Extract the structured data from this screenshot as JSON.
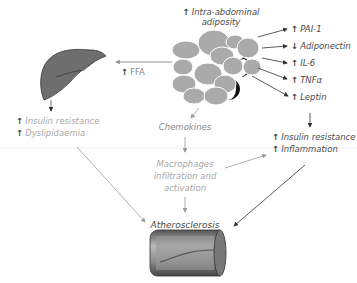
{
  "diagram": {
    "top_label": {
      "line1": "Intra-abdominal",
      "line2": "adiposity",
      "direction": "up"
    },
    "adipokines": [
      {
        "label": "PAI-1",
        "direction": "up"
      },
      {
        "label": "Adiponectin",
        "direction": "down"
      },
      {
        "label": "IL-6",
        "direction": "up"
      },
      {
        "label": "TNFα",
        "direction": "up"
      },
      {
        "label": "Leptin",
        "direction": "up"
      }
    ],
    "ffa": {
      "label": "FFA",
      "direction": "up"
    },
    "liver_effects": [
      {
        "label": "Insulin resistance",
        "direction": "up"
      },
      {
        "label": "Dyslipidaemia",
        "direction": "up"
      }
    ],
    "systemic_effects": [
      {
        "label": "Insulin resistance",
        "direction": "up"
      },
      {
        "label": "Inflammation",
        "direction": "up"
      }
    ],
    "chemokines": "Chemokines",
    "macrophages": {
      "line1": "Macrophages",
      "line2": "infiltration and",
      "line3": "activation"
    },
    "outcome": "Atherosclerosis",
    "icons": [
      "adipose-tissue-icon",
      "liver-icon",
      "artery-icon"
    ],
    "colors": {
      "text_dark": "#4a4a4a",
      "text_light": "#a8a8a8",
      "arrow_dark": "#333333",
      "arrow_light": "#9a9a9a",
      "fat_cell": "#aaaaaa",
      "liver": "#6e6e6e"
    }
  }
}
